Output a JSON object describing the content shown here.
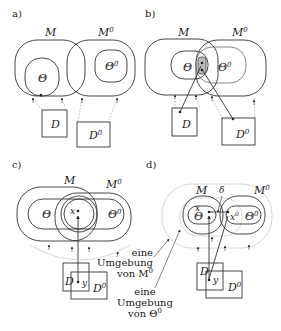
{
  "panels": {
    "a": {
      "label": "a)",
      "M": "M",
      "M0": "M",
      "M0_sup": "0",
      "Theta": "Θ",
      "Theta0": "Θ",
      "Theta0_sup": "0",
      "D": "D",
      "D0": "D",
      "D0_sup": "0"
    },
    "b": {
      "label": "b)",
      "M": "M",
      "M0": "M",
      "M0_sup": "0",
      "Theta": "Θ",
      "Theta0": "Θ",
      "Theta0_sup": "0",
      "D": "D",
      "D0": "D",
      "D0_sup": "0"
    },
    "c": {
      "label": "c)",
      "M": "M",
      "M0": "M",
      "M0_sup": "0",
      "Theta": "Θ",
      "Theta0": "Θ",
      "Theta0_sup": "0",
      "x": "x",
      "y": "y",
      "D": "D",
      "D0": "D",
      "D0_sup": "0"
    },
    "d": {
      "label": "d)",
      "M": "M",
      "M0": "M",
      "M0_sup": "0",
      "Theta": "Θ",
      "Theta0": "Θ",
      "Theta0_sup": "0",
      "x": "x",
      "x0": "x",
      "x0_sup": "0",
      "delta": "δ",
      "y": "y",
      "D": "D",
      "D0": "D",
      "D0_sup": "0",
      "annot1": [
        "eine",
        "Umgebung",
        "von M"
      ],
      "annot1_sup": "0",
      "annot2": [
        "eine",
        "Umgebung",
        "von Θ"
      ],
      "annot2_sup": "0"
    }
  }
}
